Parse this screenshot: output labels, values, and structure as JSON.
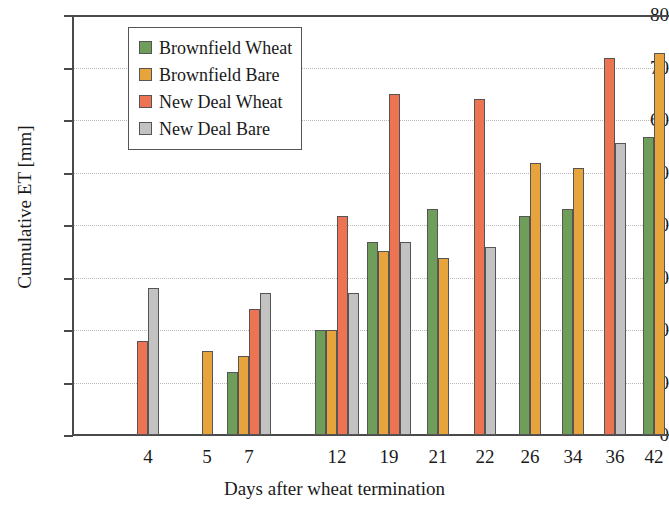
{
  "chart_data": {
    "type": "bar",
    "title": "",
    "xlabel": "Days after wheat termination",
    "ylabel": "Cumulative ET [mm]",
    "ylim": [
      0,
      80
    ],
    "ytick_values": [
      0,
      10,
      20,
      30,
      40,
      50,
      60,
      70,
      80
    ],
    "ytick_labels": [
      "0",
      "10",
      "20",
      "30",
      "40",
      "50",
      "60",
      "70",
      "80"
    ],
    "grid": "horizontal-dotted",
    "legend_position": "upper-left-inside",
    "categories": [
      "4",
      "5",
      "7",
      "12",
      "19",
      "21",
      "22",
      "26",
      "34",
      "36",
      "42"
    ],
    "series": [
      {
        "name": "Brownfield Wheat",
        "color": "#6f9e5b",
        "values": [
          null,
          null,
          12.0,
          20.0,
          36.7,
          43.0,
          null,
          41.7,
          43.0,
          null,
          56.8
        ]
      },
      {
        "name": "Brownfield Bare",
        "color": "#e8a43c",
        "values": [
          null,
          16.0,
          15.0,
          20.0,
          35.0,
          33.7,
          null,
          51.8,
          50.8,
          null,
          72.8
        ]
      },
      {
        "name": "New Deal Wheat",
        "color": "#ec7452",
        "values": [
          18.0,
          null,
          24.0,
          41.8,
          65.0,
          null,
          64.0,
          null,
          null,
          71.8,
          null
        ]
      },
      {
        "name": "New Deal Bare",
        "color": "#c2c2c2",
        "values": [
          28.0,
          null,
          27.0,
          27.0,
          36.8,
          null,
          35.8,
          null,
          null,
          55.6,
          null
        ]
      }
    ]
  },
  "legend": {
    "entries": [
      {
        "label": "Brownfield Wheat",
        "color": "#6f9e5b"
      },
      {
        "label": "Brownfield Bare",
        "color": "#e8a43c"
      },
      {
        "label": "New Deal Wheat",
        "color": "#ec7452"
      },
      {
        "label": "New Deal Bare",
        "color": "#c2c2c2"
      }
    ]
  },
  "layout": {
    "group_centers_px": [
      148,
      207,
      249,
      337,
      389,
      438,
      485,
      530,
      573,
      615,
      654
    ],
    "plot_left_px": 72,
    "plot_right_px": 669,
    "plot_top_px": 15,
    "baseline_px": 435,
    "bar_width_px": 11,
    "axis_color": "#4a4a4a",
    "grid_color": "#b9b9b9",
    "bar_edge_color": "#555555"
  }
}
